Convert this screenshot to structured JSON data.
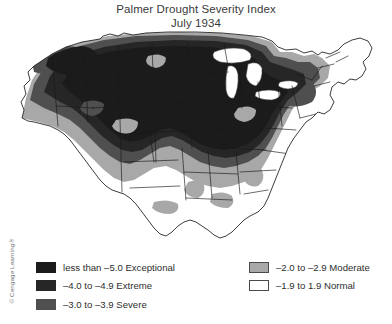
{
  "title": {
    "line1": "Palmer Drought Severity Index",
    "line2": "July 1934"
  },
  "credit": "© Cengage Learning®",
  "legend": {
    "left_column": [
      {
        "label": "less than –5.0 Exceptional",
        "color": "#1b1b1b",
        "outlined": false
      },
      {
        "label": "–4.0 to –4.9 Extreme",
        "color": "#262626",
        "outlined": false
      },
      {
        "label": "–3.0 to –3.9 Severe",
        "color": "#4f4f4f",
        "outlined": false
      }
    ],
    "right_column": [
      {
        "label": "–2.0 to –2.9 Moderate",
        "color": "#a8a8a8",
        "outlined": true
      },
      {
        "label": "–1.9 to 1.9 Normal",
        "color": "#ffffff",
        "outlined": true
      }
    ]
  },
  "chart_data": {
    "type": "map",
    "title": "Palmer Drought Severity Index",
    "subtitle": "July 1934",
    "region": "Contiguous United States",
    "measure": "Palmer Drought Severity Index (PDSI)",
    "classes": [
      {
        "name": "Exceptional",
        "range": "less than –5.0",
        "color": "#1b1b1b"
      },
      {
        "name": "Extreme",
        "range": "–4.0 to –4.9",
        "color": "#262626"
      },
      {
        "name": "Severe",
        "range": "–3.0 to –3.9",
        "color": "#4f4f4f"
      },
      {
        "name": "Moderate",
        "range": "–2.0 to –2.9",
        "color": "#a8a8a8"
      },
      {
        "name": "Normal",
        "range": "–1.9 to 1.9",
        "color": "#ffffff"
      }
    ],
    "regional_readings": [
      {
        "region": "Northern Great Plains (Dakotas, Nebraska)",
        "class": "Exceptional"
      },
      {
        "region": "Central Plains (Kansas, Missouri, Iowa)",
        "class": "Exceptional"
      },
      {
        "region": "Upper Midwest (Minnesota, Wisconsin)",
        "class": "Exceptional"
      },
      {
        "region": "Corn Belt (Illinois, Indiana, Ohio)",
        "class": "Exceptional"
      },
      {
        "region": "Northern Rockies (Montana, Wyoming)",
        "class": "Exceptional"
      },
      {
        "region": "Great Basin (Nevada, Utah)",
        "class": "Severe"
      },
      {
        "region": "Pacific Northwest (Washington, Oregon)",
        "class": "Severe"
      },
      {
        "region": "California",
        "class": "Moderate"
      },
      {
        "region": "Desert Southwest (Arizona, New Mexico)",
        "class": "Moderate"
      },
      {
        "region": "West Texas / Panhandle",
        "class": "Severe"
      },
      {
        "region": "East Texas and Gulf Coast",
        "class": "Normal"
      },
      {
        "region": "Mid-Atlantic (Pennsylvania, New York)",
        "class": "Severe"
      },
      {
        "region": "New England (Maine, Vermont)",
        "class": "Normal"
      },
      {
        "region": "Southeast (Georgia, Florida, Carolinas)",
        "class": "Normal"
      },
      {
        "region": "Mississippi Valley (Arkansas, Louisiana)",
        "class": "Normal"
      }
    ]
  }
}
